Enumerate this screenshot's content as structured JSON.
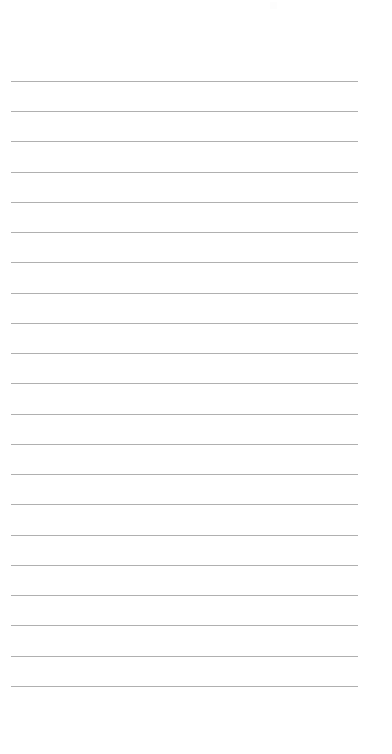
{
  "page": {
    "kind": "lined-paper-sheet",
    "width": 392,
    "height": 754,
    "background_color": "#ffffff",
    "orientation": "portrait",
    "text_content": "",
    "is_blank": true
  },
  "rules": {
    "count": 21,
    "line_color": "#b0b0b0",
    "line_thickness_px": 1,
    "left_x": 11,
    "right_x": 358,
    "line_length_px": 347,
    "first_line_y": 81,
    "last_line_y": 686,
    "spacing_px": 30.25,
    "y_positions": [
      81,
      111,
      141,
      172,
      202,
      232,
      262,
      293,
      323,
      353,
      383,
      414,
      444,
      474,
      504,
      535,
      565,
      595,
      625,
      656,
      686
    ]
  },
  "margins": {
    "left_margin_px": 11,
    "right_margin_px": 34,
    "top_blank_px": 81,
    "bottom_blank_px": 67
  },
  "marks": {
    "faint_smudge": {
      "label": "faint-mark",
      "x": 270,
      "y": 2,
      "color": "#fdfdfd"
    }
  }
}
